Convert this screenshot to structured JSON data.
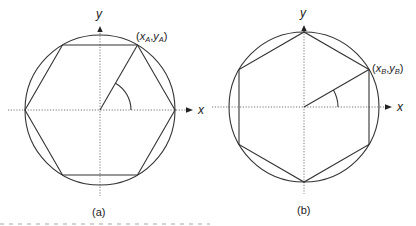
{
  "figure": {
    "panels": [
      {
        "id": "a",
        "label": "(a)",
        "axis_x_label": "x",
        "axis_y_label": "y",
        "point_label": {
          "x": "x",
          "x_sub": "A",
          "sep": ",",
          "y": "y",
          "y_sub": "A"
        },
        "hexagon_orientation": "flat-top",
        "radius_line_angle_deg": 60
      },
      {
        "id": "b",
        "label": "(b)",
        "axis_x_label": "x",
        "axis_y_label": "y",
        "point_label": {
          "x": "x",
          "x_sub": "B",
          "sep": ",",
          "y": "y",
          "y_sub": "B"
        },
        "hexagon_orientation": "pointy-top",
        "radius_line_angle_deg": 30
      }
    ],
    "colors": {
      "stroke": "#333333",
      "axis": "#555555",
      "text": "#222222"
    }
  }
}
